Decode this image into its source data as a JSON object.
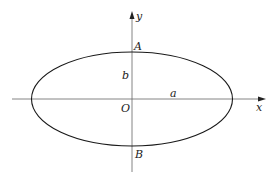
{
  "diagram": {
    "type": "ellipse-with-axes",
    "colors": {
      "stroke": "#1a1a1a",
      "axis": "#555555",
      "text": "#222222"
    },
    "axes": {
      "x_label": "x",
      "y_label": "y"
    },
    "ellipse": {
      "center_label": "O",
      "semi_major_label": "a",
      "semi_minor_label": "b",
      "top_vertex_label": "A",
      "bottom_vertex_label": "B"
    }
  }
}
